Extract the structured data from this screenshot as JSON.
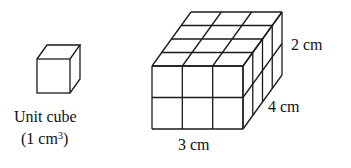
{
  "unit_cube": {
    "label": "Unit cube",
    "volume_prefix": "(1 cm",
    "volume_exp": "3",
    "volume_suffix": ")"
  },
  "prism": {
    "length_label": "3 cm",
    "depth_label": "4 cm",
    "height_label": "2 cm",
    "dims": {
      "length": 3,
      "depth": 4,
      "height": 2
    }
  },
  "colors": {
    "stroke": "#1a1a1a",
    "background": "#ffffff"
  }
}
